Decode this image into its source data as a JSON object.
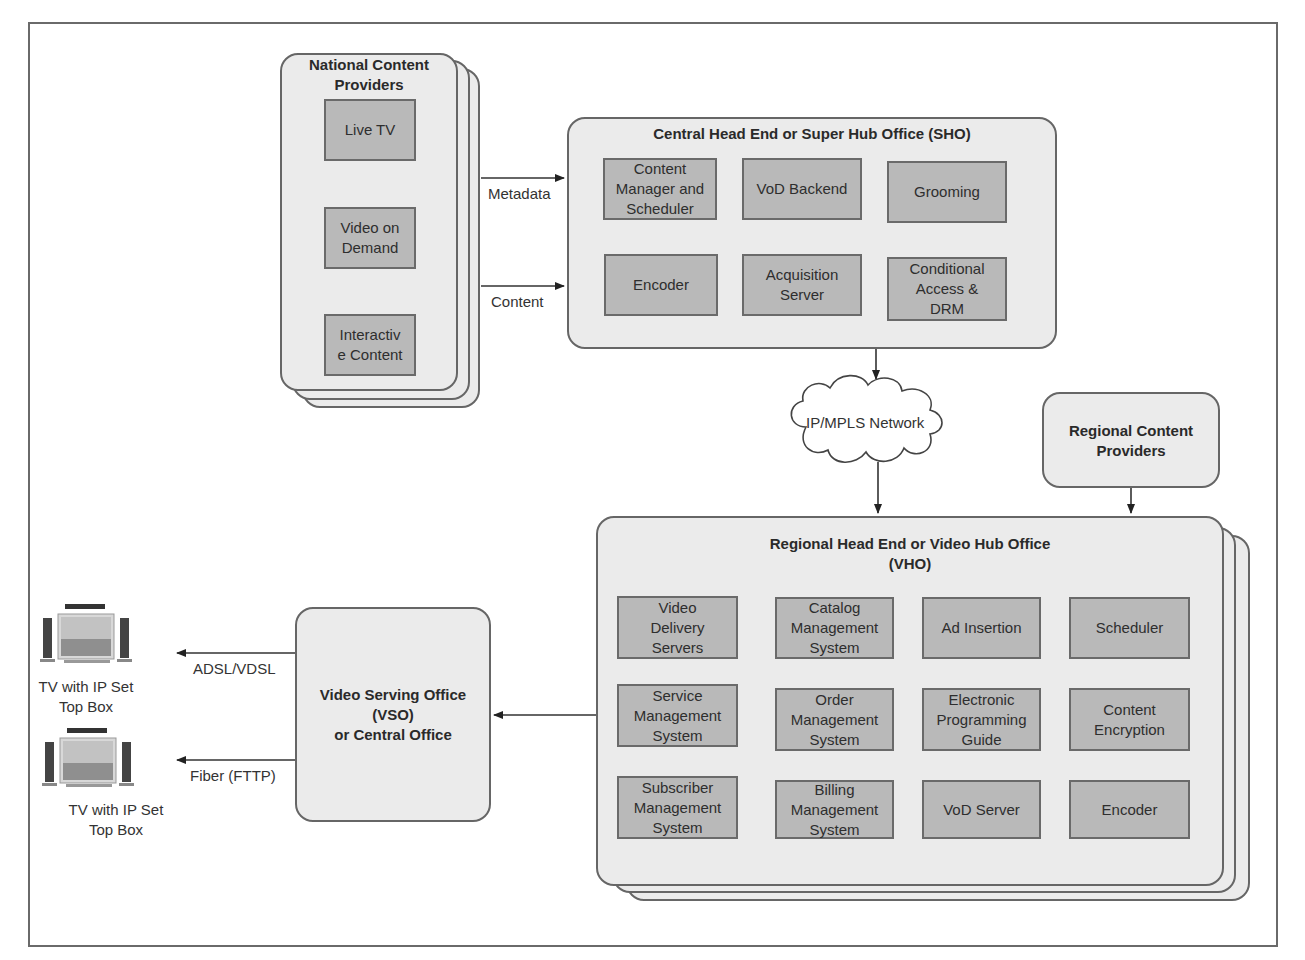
{
  "national_providers": {
    "title": "National Content\nProviders",
    "items": [
      "Live TV",
      "Video on\nDemand",
      "Interactiv\ne Content"
    ]
  },
  "arrows": {
    "metadata": "Metadata",
    "content": "Content",
    "adsl": "ADSL/VDSL",
    "fiber": "Fiber (FTTP)"
  },
  "sho": {
    "title": "Central Head End or Super Hub Office (SHO)",
    "items": [
      "Content\nManager and\nScheduler",
      "VoD Backend",
      "Grooming",
      "Encoder",
      "Acquisition\nServer",
      "Conditional\nAccess &\nDRM"
    ]
  },
  "network": {
    "label": "IP/MPLS Network"
  },
  "regional_providers": {
    "title": "Regional Content\nProviders"
  },
  "vho": {
    "title": "Regional Head End or Video Hub Office\n(VHO)",
    "items": [
      "Video\nDelivery\nServers",
      "Catalog\nManagement\nSystem",
      "Ad Insertion",
      "Scheduler",
      "Service\nManagement\nSystem",
      "Order\nManagement\nSystem",
      "Electronic\nProgramming\nGuide",
      "Content\nEncryption",
      "Subscriber\nManagement\nSystem",
      "Billing\nManagement\nSystem",
      "VoD Server",
      "Encoder"
    ]
  },
  "vso": {
    "title": "Video Serving Office\n(VSO)\nor Central Office"
  },
  "tvs": [
    {
      "label": "TV with IP Set\nTop Box"
    },
    {
      "label": "TV with IP Set\nTop Box"
    }
  ]
}
